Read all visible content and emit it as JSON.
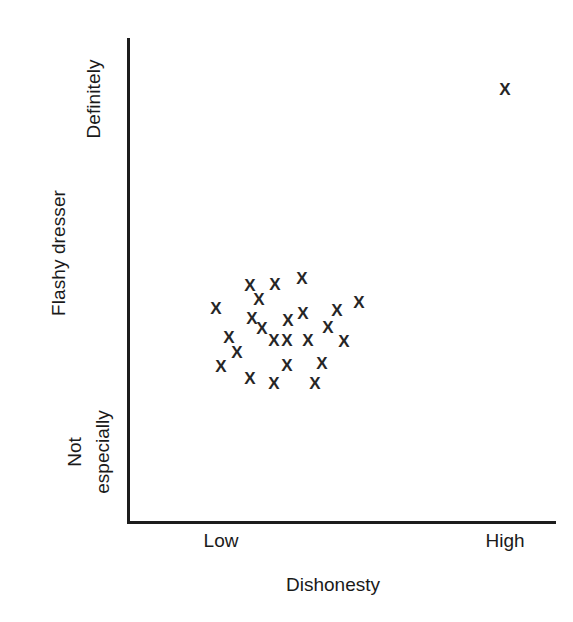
{
  "chart_data": {
    "type": "scatter",
    "title": "",
    "xlabel": "Dishonesty",
    "ylabel": "Flashy dresser",
    "xticklabels": [
      "Low",
      "High"
    ],
    "yticklabels": [
      "Not especially",
      "Definitely"
    ],
    "ytick_bottom_line1": "Not",
    "ytick_bottom_line2": "especially",
    "ytick_top": "Definitely",
    "grid": false,
    "legend": "none",
    "marker": "x",
    "marker_color": "#262626",
    "axis_color": "#1d1d1d",
    "xlim": [
      0,
      100
    ],
    "ylim": [
      0,
      100
    ],
    "point_count": 25,
    "points": [
      {
        "x": 28.5,
        "y": 49.0,
        "px": 250,
        "py": 285
      },
      {
        "x": 34.3,
        "y": 49.2,
        "px": 275,
        "py": 284
      },
      {
        "x": 40.6,
        "y": 50.4,
        "px": 302,
        "py": 278
      },
      {
        "x": 20.5,
        "y": 44.3,
        "px": 216,
        "py": 308
      },
      {
        "x": 28.9,
        "y": 42.2,
        "px": 252,
        "py": 318
      },
      {
        "x": 37.3,
        "y": 41.6,
        "px": 288,
        "py": 320
      },
      {
        "x": 40.9,
        "y": 43.0,
        "px": 303,
        "py": 313
      },
      {
        "x": 48.8,
        "y": 43.6,
        "px": 337,
        "py": 310
      },
      {
        "x": 54.0,
        "y": 45.3,
        "px": 359,
        "py": 302
      },
      {
        "x": 23.5,
        "y": 38.1,
        "px": 229,
        "py": 337
      },
      {
        "x": 34.0,
        "y": 37.5,
        "px": 274,
        "py": 340
      },
      {
        "x": 37.1,
        "y": 37.5,
        "px": 287,
        "py": 340
      },
      {
        "x": 42.0,
        "y": 37.5,
        "px": 308,
        "py": 340
      },
      {
        "x": 50.4,
        "y": 37.3,
        "px": 344,
        "py": 341
      },
      {
        "x": 21.7,
        "y": 32.1,
        "px": 221,
        "py": 366
      },
      {
        "x": 28.5,
        "y": 29.6,
        "px": 250,
        "py": 378
      },
      {
        "x": 37.1,
        "y": 32.3,
        "px": 287,
        "py": 365
      },
      {
        "x": 45.2,
        "y": 32.7,
        "px": 322,
        "py": 363
      },
      {
        "x": 34.0,
        "y": 29.5,
        "px": 274,
        "py": 383
      },
      {
        "x": 43.6,
        "y": 29.5,
        "px": 315,
        "py": 383
      },
      {
        "x": 30.7,
        "y": 46.0,
        "px": 259,
        "py": 299
      },
      {
        "x": 25.6,
        "y": 34.8,
        "px": 237,
        "py": 352
      },
      {
        "x": 31.4,
        "y": 40.0,
        "px": 262,
        "py": 328
      },
      {
        "x": 46.6,
        "y": 40.2,
        "px": 328,
        "py": 327
      },
      {
        "x": 94.2,
        "y": 89.1,
        "px": 505,
        "py": 89
      }
    ]
  },
  "axes": {
    "y_axis_label": "Flashy dresser",
    "y_tick_top": "Definitely",
    "y_tick_bottom_line1": "Not",
    "y_tick_bottom_line2": "especially",
    "x_tick_low": "Low",
    "x_tick_high": "High",
    "x_axis_label": "Dishonesty"
  },
  "marker_glyph": "X"
}
